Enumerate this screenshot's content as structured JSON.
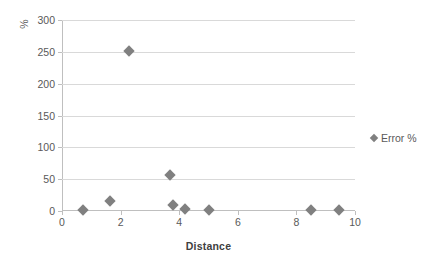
{
  "chart_data": {
    "type": "scatter",
    "title": "",
    "xlabel": "Distance",
    "ylabel": "%",
    "xlim": [
      0,
      10
    ],
    "ylim": [
      0,
      300
    ],
    "xticks": [
      "0",
      "2",
      "4",
      "6",
      "8",
      "10"
    ],
    "xtick_values": [
      0,
      2,
      4,
      6,
      8,
      10
    ],
    "yticks": [
      "0",
      "50",
      "100",
      "150",
      "200",
      "250",
      "300"
    ],
    "ytick_values": [
      0,
      50,
      100,
      150,
      200,
      250,
      300
    ],
    "grid": "horizontal",
    "legend_position": "right",
    "marker": "diamond",
    "marker_color": "#808080",
    "gridline_color": "#d9d9d9",
    "axis_color": "#bfbfbf",
    "text_color": "#595959",
    "background": "#ffffff",
    "series": [
      {
        "name": "Error %",
        "x": [
          0.7,
          1.65,
          2.3,
          3.7,
          3.78,
          4.2,
          5.0,
          8.5,
          9.45
        ],
        "values": [
          2,
          16,
          252,
          56,
          9,
          3,
          1,
          2,
          2
        ]
      }
    ]
  },
  "legend": {
    "entries": [
      {
        "label": "Error %"
      }
    ]
  }
}
